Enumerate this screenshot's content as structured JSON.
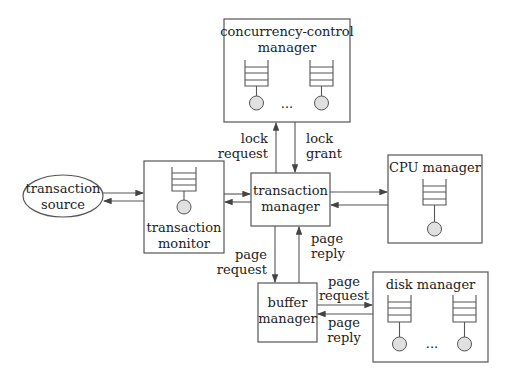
{
  "diagram": {
    "nodes": {
      "transaction_source": {
        "line1": "transaction",
        "line2": "source"
      },
      "transaction_monitor": {
        "line1": "transaction",
        "line2": "monitor"
      },
      "transaction_manager": {
        "line1": "transaction",
        "line2": "manager"
      },
      "concurrency_control_manager": {
        "line1": "concurrency-control",
        "line2": "manager",
        "ellipsis": "..."
      },
      "cpu_manager": {
        "line1": "CPU manager"
      },
      "buffer_manager": {
        "line1": "buffer",
        "line2": "manager"
      },
      "disk_manager": {
        "line1": "disk manager",
        "ellipsis": "..."
      }
    },
    "edges": {
      "lock_request": {
        "line1": "lock",
        "line2": "request"
      },
      "lock_grant": {
        "line1": "lock",
        "line2": "grant"
      },
      "page_request_tm": {
        "line1": "page",
        "line2": "request"
      },
      "page_reply_tm": {
        "line1": "page",
        "line2": "reply"
      },
      "page_request_disk": {
        "line1": "page",
        "line2": "request"
      },
      "page_reply_disk": {
        "line1": "page",
        "line2": "reply"
      }
    },
    "colors": {
      "stroke": "#555555",
      "server_fill": "#e0e0e0",
      "text": "#222222"
    }
  }
}
